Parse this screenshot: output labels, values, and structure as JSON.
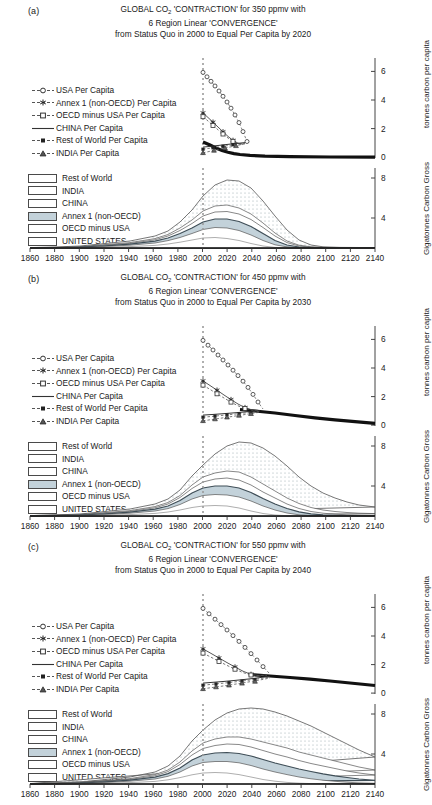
{
  "figure": {
    "xlabel_years": [
      "1860",
      "1880",
      "1900",
      "1920",
      "1940",
      "1960",
      "1980",
      "2000",
      "2020",
      "2040",
      "2060",
      "2080",
      "2100",
      "2120",
      "2140"
    ],
    "axis_titles": {
      "per_capita": "tonnes carbon per capita",
      "gross": "Gigatonnes Carbon Gross"
    },
    "percapita_ticks": [
      "6",
      "4",
      "2",
      "0"
    ],
    "gross_ticks": [
      "8",
      "4"
    ],
    "line_legend": [
      {
        "label": "USA Per Capita",
        "marker": "open-circle"
      },
      {
        "label": "Annex 1 (non-OECD) Per Capita",
        "marker": "star"
      },
      {
        "label": "OECD minus USA Per Capita",
        "marker": "open-square"
      },
      {
        "label": "CHINA Per Capita",
        "marker": "plain-line"
      },
      {
        "label": "Rest of World Per Capita",
        "marker": "filled-square"
      },
      {
        "label": "INDIA Per Capita",
        "marker": "triangle"
      }
    ],
    "area_legend": [
      {
        "label": "Rest of World",
        "fill": "#ffffff"
      },
      {
        "label": "INDIA",
        "fill": "#ffffff"
      },
      {
        "label": "CHINA",
        "fill": "#ffffff"
      },
      {
        "label": "Annex 1 (non-OECD)",
        "fill": "#c3d2da"
      },
      {
        "label": "OECD minus USA",
        "fill": "#ffffff"
      },
      {
        "label": "UNITED STATES",
        "fill": "#ffffff"
      }
    ],
    "reference_line_year": "2000"
  },
  "panels": [
    {
      "tag": "(a)",
      "title_line1_a": "GLOBAL CO",
      "title_line1_b": "2",
      "title_line1_c": " 'CONTRACTION' for 350 ppmv with",
      "title_line2": "6 Region Linear 'CONVERGENCE'",
      "title_line3": "from Status Quo in 2000 to Equal Per Capita by 2020",
      "ppmv": "350",
      "convergence_year": "2020"
    },
    {
      "tag": "(b)",
      "title_line1_a": "GLOBAL CO",
      "title_line1_b": "2",
      "title_line1_c": " 'CONTRACTION' for 450 ppmv with",
      "title_line2": "6 Region Linear 'CONVERGENCE'",
      "title_line3": "from Status Quo in 2000 to Equal Per Capita by 2030",
      "ppmv": "450",
      "convergence_year": "2030"
    },
    {
      "tag": "(c)",
      "title_line1_a": "GLOBAL CO",
      "title_line1_b": "2",
      "title_line1_c": " 'CONTRACTION' for 550 ppmv with",
      "title_line2": "6 Region Linear 'CONVERGENCE'",
      "title_line3": "from Status Quo in 2000 to Equal Per Capita by 2040",
      "ppmv": "550",
      "convergence_year": "2040"
    }
  ],
  "chart_data": [
    {
      "type": "line",
      "panel": "(a)",
      "title": "GLOBAL CO2 'CONTRACTION' for 350 ppmv with 6 Region Linear 'CONVERGENCE' from Status Quo in 2000 to Equal Per Capita by 2020",
      "subplot": "per-capita",
      "xlabel": "",
      "ylabel": "tonnes carbon per capita",
      "xlim": [
        1860,
        2140
      ],
      "ylim": [
        0,
        7
      ],
      "grid": false,
      "x": [
        2000,
        2004,
        2008,
        2012,
        2016,
        2020,
        2030,
        2040,
        2060,
        2080,
        2100,
        2120,
        2140
      ],
      "series": [
        {
          "name": "USA Per Capita",
          "values": [
            6.1,
            5.2,
            4.2,
            3.2,
            2.2,
            1.05,
            0.95,
            0.85,
            0.8,
            0.8,
            0.8,
            0.8,
            0.8
          ]
        },
        {
          "name": "Annex 1 (non-OECD) Per Capita",
          "values": [
            3.3,
            2.85,
            2.35,
            1.85,
            1.4,
            1.05,
            0.95,
            0.85,
            0.8,
            0.8,
            0.8,
            0.8,
            0.8
          ]
        },
        {
          "name": "OECD minus USA Per Capita",
          "values": [
            3.0,
            2.6,
            2.2,
            1.75,
            1.35,
            1.05,
            0.95,
            0.85,
            0.8,
            0.8,
            0.8,
            0.8,
            0.8
          ]
        },
        {
          "name": "CHINA Per Capita",
          "values": [
            0.7,
            0.78,
            0.86,
            0.93,
            1.0,
            1.05,
            0.95,
            0.85,
            0.8,
            0.8,
            0.8,
            0.8,
            0.8
          ]
        },
        {
          "name": "Rest of World Per Capita",
          "values": [
            0.55,
            0.66,
            0.77,
            0.87,
            0.97,
            1.05,
            0.95,
            0.85,
            0.8,
            0.8,
            0.8,
            0.8,
            0.8
          ]
        },
        {
          "name": "INDIA Per Capita",
          "values": [
            0.3,
            0.45,
            0.6,
            0.75,
            0.92,
            1.05,
            0.95,
            0.85,
            0.8,
            0.8,
            0.8,
            0.8,
            0.8
          ]
        }
      ],
      "annotations": [
        "vertical dotted reference line at year 2000"
      ]
    },
    {
      "type": "area",
      "panel": "(a)",
      "subplot": "gross-emissions-stacked",
      "xlabel": "",
      "ylabel": "Gigatonnes Carbon Gross",
      "xlim": [
        1860,
        2140
      ],
      "ylim": [
        0,
        9
      ],
      "grid": false,
      "stacked": true,
      "x": [
        1860,
        1880,
        1900,
        1920,
        1940,
        1960,
        1980,
        2000,
        2010,
        2020,
        2040,
        2060,
        2080,
        2100,
        2120,
        2140
      ],
      "series": [
        {
          "name": "UNITED STATES",
          "values": [
            0.0,
            0.1,
            0.3,
            0.7,
            0.8,
            1.0,
            1.3,
            1.6,
            1.5,
            1.1,
            0.3,
            0.05,
            0.02,
            0.02,
            0.02,
            0.02
          ]
        },
        {
          "name": "OECD minus USA",
          "values": [
            0.05,
            0.2,
            0.4,
            0.6,
            0.7,
            0.9,
            1.2,
            1.3,
            1.2,
            0.9,
            0.25,
            0.05,
            0.02,
            0.02,
            0.02,
            0.02
          ]
        },
        {
          "name": "Annex 1 (non-OECD)",
          "values": [
            0.0,
            0.05,
            0.1,
            0.2,
            0.4,
            0.7,
            1.2,
            0.9,
            0.85,
            0.6,
            0.2,
            0.04,
            0.02,
            0.02,
            0.02,
            0.02
          ]
        },
        {
          "name": "CHINA",
          "values": [
            0.0,
            0.0,
            0.02,
            0.05,
            0.1,
            0.3,
            0.6,
            0.9,
            1.0,
            0.8,
            0.25,
            0.05,
            0.02,
            0.02,
            0.02,
            0.02
          ]
        },
        {
          "name": "INDIA",
          "values": [
            0.0,
            0.0,
            0.01,
            0.02,
            0.05,
            0.1,
            0.2,
            0.35,
            0.45,
            0.4,
            0.15,
            0.03,
            0.01,
            0.01,
            0.01,
            0.01
          ]
        },
        {
          "name": "Rest of World",
          "values": [
            0.0,
            0.02,
            0.05,
            0.1,
            0.2,
            0.5,
            1.0,
            2.0,
            2.9,
            2.6,
            0.9,
            0.15,
            0.05,
            0.04,
            0.04,
            0.04
          ]
        }
      ],
      "total_peak": {
        "year": 2010,
        "value": 7.9
      },
      "annotations": [
        "vertical dotted reference line at year 2000"
      ]
    },
    {
      "type": "line",
      "panel": "(b)",
      "title": "GLOBAL CO2 'CONTRACTION' for 450 ppmv with 6 Region Linear 'CONVERGENCE' from Status Quo in 2000 to Equal Per Capita by 2030",
      "subplot": "per-capita",
      "xlabel": "",
      "ylabel": "tonnes carbon per capita",
      "xlim": [
        1860,
        2140
      ],
      "ylim": [
        0,
        7
      ],
      "grid": false,
      "x": [
        2000,
        2005,
        2010,
        2015,
        2020,
        2025,
        2030,
        2050,
        2070,
        2090,
        2110,
        2140
      ],
      "series": [
        {
          "name": "USA Per Capita",
          "values": [
            6.1,
            5.3,
            4.4,
            3.5,
            2.7,
            1.9,
            1.15,
            1.0,
            0.75,
            0.55,
            0.4,
            0.3
          ]
        },
        {
          "name": "Annex 1 (non-OECD) Per Capita",
          "values": [
            3.3,
            2.95,
            2.6,
            2.2,
            1.85,
            1.5,
            1.15,
            1.0,
            0.75,
            0.55,
            0.4,
            0.3
          ]
        },
        {
          "name": "OECD minus USA Per Capita",
          "values": [
            2.95,
            2.65,
            2.35,
            2.05,
            1.75,
            1.45,
            1.15,
            1.0,
            0.75,
            0.55,
            0.4,
            0.3
          ]
        },
        {
          "name": "CHINA Per Capita",
          "values": [
            0.7,
            0.78,
            0.85,
            0.93,
            1.0,
            1.08,
            1.15,
            1.0,
            0.75,
            0.55,
            0.4,
            0.3
          ]
        },
        {
          "name": "Rest of World Per Capita",
          "values": [
            0.55,
            0.65,
            0.75,
            0.85,
            0.95,
            1.05,
            1.15,
            1.0,
            0.75,
            0.55,
            0.4,
            0.3
          ]
        },
        {
          "name": "INDIA Per Capita",
          "values": [
            0.3,
            0.44,
            0.58,
            0.72,
            0.86,
            1.0,
            1.15,
            1.0,
            0.75,
            0.55,
            0.4,
            0.3
          ]
        }
      ],
      "annotations": [
        "vertical dotted reference line at year 2000"
      ]
    },
    {
      "type": "area",
      "panel": "(b)",
      "subplot": "gross-emissions-stacked",
      "xlabel": "",
      "ylabel": "Gigatonnes Carbon Gross",
      "xlim": [
        1860,
        2140
      ],
      "ylim": [
        0,
        9
      ],
      "grid": false,
      "stacked": true,
      "x": [
        1860,
        1880,
        1900,
        1920,
        1940,
        1960,
        1980,
        2000,
        2020,
        2040,
        2060,
        2080,
        2100,
        2120,
        2140
      ],
      "series": [
        {
          "name": "UNITED STATES",
          "values": [
            0.0,
            0.1,
            0.3,
            0.7,
            0.8,
            1.0,
            1.3,
            1.6,
            1.3,
            0.8,
            0.55,
            0.4,
            0.3,
            0.25,
            0.2
          ]
        },
        {
          "name": "OECD minus USA",
          "values": [
            0.05,
            0.2,
            0.4,
            0.6,
            0.7,
            0.9,
            1.2,
            1.3,
            1.1,
            0.7,
            0.5,
            0.35,
            0.28,
            0.22,
            0.18
          ]
        },
        {
          "name": "Annex 1 (non-OECD)",
          "values": [
            0.0,
            0.05,
            0.1,
            0.2,
            0.4,
            0.7,
            1.2,
            0.9,
            0.75,
            0.5,
            0.35,
            0.25,
            0.2,
            0.16,
            0.14
          ]
        },
        {
          "name": "CHINA",
          "values": [
            0.0,
            0.0,
            0.02,
            0.05,
            0.1,
            0.3,
            0.6,
            0.9,
            1.0,
            0.7,
            0.5,
            0.35,
            0.28,
            0.22,
            0.18
          ]
        },
        {
          "name": "INDIA",
          "values": [
            0.0,
            0.0,
            0.01,
            0.02,
            0.05,
            0.1,
            0.2,
            0.35,
            0.5,
            0.4,
            0.3,
            0.22,
            0.18,
            0.15,
            0.12
          ]
        },
        {
          "name": "Rest of World",
          "values": [
            0.0,
            0.02,
            0.05,
            0.1,
            0.2,
            0.5,
            1.0,
            2.0,
            3.5,
            3.3,
            2.4,
            1.7,
            1.2,
            0.9,
            0.7
          ]
        }
      ],
      "total_peak": {
        "year": 2015,
        "value": 8.3
      },
      "annotations": [
        "vertical dotted reference line at year 2000"
      ]
    },
    {
      "type": "line",
      "panel": "(c)",
      "title": "GLOBAL CO2 'CONTRACTION' for 550 ppmv with 6 Region Linear 'CONVERGENCE' from Status Quo in 2000 to Equal Per Capita by 2040",
      "subplot": "per-capita",
      "xlabel": "",
      "ylabel": "tonnes carbon per capita",
      "xlim": [
        1860,
        2140
      ],
      "ylim": [
        0,
        7
      ],
      "grid": false,
      "x": [
        2000,
        2008,
        2016,
        2024,
        2032,
        2040,
        2060,
        2080,
        2100,
        2120,
        2140
      ],
      "series": [
        {
          "name": "USA Per Capita",
          "values": [
            6.1,
            5.15,
            4.1,
            3.1,
            2.2,
            1.35,
            1.2,
            1.05,
            0.9,
            0.75,
            0.6
          ]
        },
        {
          "name": "Annex 1 (non-OECD) Per Capita",
          "values": [
            3.3,
            2.95,
            2.5,
            2.1,
            1.7,
            1.35,
            1.2,
            1.05,
            0.9,
            0.75,
            0.6
          ]
        },
        {
          "name": "OECD minus USA Per Capita",
          "values": [
            2.95,
            2.65,
            2.3,
            1.95,
            1.62,
            1.35,
            1.2,
            1.05,
            0.9,
            0.75,
            0.6
          ]
        },
        {
          "name": "CHINA Per Capita",
          "values": [
            0.7,
            0.82,
            0.95,
            1.08,
            1.22,
            1.35,
            1.2,
            1.05,
            0.9,
            0.75,
            0.6
          ]
        },
        {
          "name": "Rest of World Per Capita",
          "values": [
            0.55,
            0.7,
            0.85,
            1.0,
            1.18,
            1.35,
            1.2,
            1.05,
            0.9,
            0.75,
            0.6
          ]
        },
        {
          "name": "INDIA Per Capita",
          "values": [
            0.3,
            0.5,
            0.7,
            0.92,
            1.13,
            1.35,
            1.2,
            1.05,
            0.9,
            0.75,
            0.6
          ]
        }
      ],
      "annotations": [
        "vertical dotted reference line at year 2000"
      ]
    },
    {
      "type": "area",
      "panel": "(c)",
      "subplot": "gross-emissions-stacked",
      "xlabel": "",
      "ylabel": "Gigatonnes Carbon Gross",
      "xlim": [
        1860,
        2140
      ],
      "ylim": [
        0,
        10
      ],
      "grid": false,
      "stacked": true,
      "x": [
        1860,
        1880,
        1900,
        1920,
        1940,
        1960,
        1980,
        2000,
        2020,
        2040,
        2060,
        2080,
        2100,
        2120,
        2140
      ],
      "series": [
        {
          "name": "UNITED STATES",
          "values": [
            0.0,
            0.1,
            0.3,
            0.7,
            0.8,
            1.0,
            1.3,
            1.6,
            1.45,
            1.0,
            0.8,
            0.7,
            0.6,
            0.55,
            0.5
          ]
        },
        {
          "name": "OECD minus USA",
          "values": [
            0.05,
            0.2,
            0.4,
            0.6,
            0.7,
            0.9,
            1.2,
            1.3,
            1.2,
            0.9,
            0.75,
            0.65,
            0.55,
            0.5,
            0.45
          ]
        },
        {
          "name": "Annex 1 (non-OECD)",
          "values": [
            0.0,
            0.05,
            0.1,
            0.2,
            0.4,
            0.7,
            1.2,
            0.9,
            0.85,
            0.65,
            0.5,
            0.42,
            0.36,
            0.32,
            0.3
          ]
        },
        {
          "name": "CHINA",
          "values": [
            0.0,
            0.0,
            0.02,
            0.05,
            0.1,
            0.3,
            0.6,
            0.9,
            1.1,
            0.95,
            0.8,
            0.7,
            0.6,
            0.55,
            0.5
          ]
        },
        {
          "name": "INDIA",
          "values": [
            0.0,
            0.0,
            0.01,
            0.02,
            0.05,
            0.1,
            0.2,
            0.35,
            0.55,
            0.55,
            0.5,
            0.45,
            0.4,
            0.36,
            0.33
          ]
        },
        {
          "name": "Rest of World",
          "values": [
            0.0,
            0.02,
            0.05,
            0.1,
            0.2,
            0.5,
            1.0,
            2.0,
            3.7,
            4.2,
            3.9,
            3.4,
            2.9,
            2.5,
            2.2
          ]
        }
      ],
      "total_peak": {
        "year": 2030,
        "value": 8.6
      },
      "annotations": [
        "vertical dotted reference line at year 2000"
      ]
    }
  ]
}
